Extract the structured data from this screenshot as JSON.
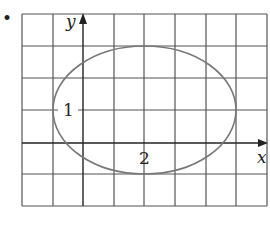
{
  "diagram": {
    "type": "ellipse-on-grid",
    "bullet": "•",
    "axes": {
      "x_label": "x",
      "y_label": "y",
      "tick_labels": [
        {
          "axis": "y",
          "value": 1,
          "text": "1"
        },
        {
          "axis": "x",
          "value": 2,
          "text": "2"
        }
      ]
    },
    "grid": {
      "x_range": [
        -2,
        6
      ],
      "y_range": [
        -2,
        4
      ],
      "step": 1
    },
    "ellipse": {
      "center": [
        2,
        1
      ],
      "semi_axis_x": 3,
      "semi_axis_y": 2
    },
    "colors": {
      "grid": "#555555",
      "curve": "#777777",
      "text": "#222222"
    }
  }
}
